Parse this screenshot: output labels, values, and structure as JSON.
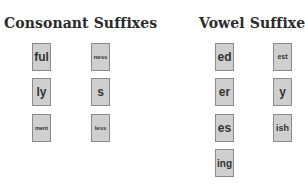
{
  "consonant": {
    "title": "Consonant Suffixes",
    "cards": [
      {
        "label": "ful"
      },
      {
        "label": "ness"
      },
      {
        "label": "ly"
      },
      {
        "label": "s"
      },
      {
        "label": "ment"
      },
      {
        "label": "less"
      }
    ]
  },
  "vowel": {
    "title": "Vowel Suffixes",
    "cards": [
      {
        "label": "ed"
      },
      {
        "label": "est"
      },
      {
        "label": "er"
      },
      {
        "label": "y"
      },
      {
        "label": "es"
      },
      {
        "label": "ish"
      },
      {
        "label": "ing"
      }
    ]
  },
  "colors": {
    "card_fill": "#cfcfcf",
    "card_border": "#8a8a8a",
    "text": "#333333"
  }
}
